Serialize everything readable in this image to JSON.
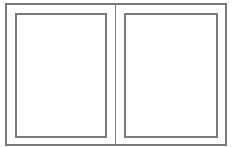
{
  "diagram": {
    "type": "two-panel-frame",
    "line_color": "#7a7a7a",
    "background": "#ffffff",
    "outer_frame": {
      "x": 5,
      "y": 3,
      "width": 222,
      "height": 143
    },
    "divider": {
      "x": 115,
      "y": 3,
      "width": 1,
      "height": 143
    },
    "panels": [
      {
        "id": "left",
        "x": 15,
        "y": 13,
        "width": 92,
        "height": 125
      },
      {
        "id": "right",
        "x": 124,
        "y": 13,
        "width": 94,
        "height": 125
      }
    ]
  }
}
